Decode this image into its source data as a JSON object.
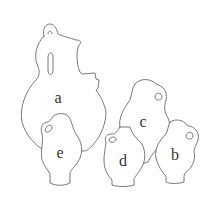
{
  "figure": {
    "labels": {
      "a": "a",
      "b": "b",
      "c": "c",
      "d": "d",
      "e": "e"
    },
    "colors": {
      "background": "#ffffff",
      "outline": "#6a6a6a",
      "label": "#333333"
    }
  }
}
